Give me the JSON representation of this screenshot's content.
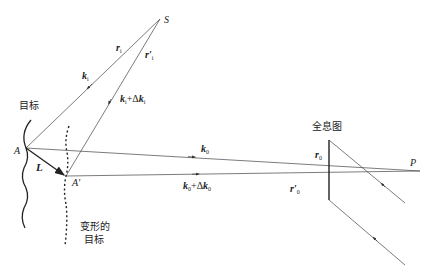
{
  "diagram": {
    "points": {
      "S": "S",
      "A": "A",
      "A_prime": "A′",
      "P": "P"
    },
    "labels": {
      "target": "目标",
      "deformed_target_line1": "变形的",
      "deformed_target_line2": "目标",
      "hologram": "全息图",
      "displacement": "L",
      "r_i": "r",
      "r_i_sub": "i",
      "r_i_prime": "r′",
      "r_i_prime_sub": "i",
      "k_i": "k",
      "k_i_sub": "i",
      "k_i_dk": "k",
      "k_i_dk_sub": "i",
      "k_i_dk_plus": "+Δ",
      "k_i_dk2": "k",
      "k_i_dk2_sub": "i",
      "k_0": "k",
      "k_0_sub": "0",
      "k_0_dk": "k",
      "k_0_dk_sub": "0",
      "k_0_dk_plus": "+Δ",
      "k_0_dk2": "k",
      "k_0_dk2_sub": "0",
      "r_0": "r",
      "r_0_sub": "0",
      "r_0_prime": "r′",
      "r_0_prime_sub": "0"
    },
    "colors": {
      "line": "#333333",
      "background": "#ffffff"
    }
  }
}
